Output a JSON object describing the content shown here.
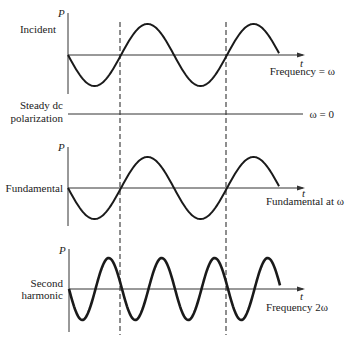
{
  "panels": [
    {
      "id": "incident",
      "label_lines": [
        "Incident"
      ],
      "axis_label_y": "P",
      "axis_label_x": "t",
      "note": "Frequency = ω",
      "frequency_multiple": 1
    },
    {
      "id": "steady-dc",
      "label_lines": [
        "Steady dc",
        "polarization"
      ],
      "note": "ω = 0",
      "frequency_multiple": 0
    },
    {
      "id": "fundamental",
      "label_lines": [
        "Fundamental"
      ],
      "axis_label_y": "P",
      "axis_label_x": "t",
      "note": "Fundamental at ω",
      "frequency_multiple": 1
    },
    {
      "id": "second-harmonic",
      "label_lines": [
        "Second",
        "harmonic"
      ],
      "axis_label_y": "P",
      "axis_label_x": "t",
      "note": "Frequency 2ω",
      "frequency_multiple": 2
    }
  ],
  "labels": {
    "incident": "Incident",
    "incident_note": "Frequency = ω",
    "dc_line1": "Steady dc",
    "dc_line2": "polarization",
    "dc_note": "ω = 0",
    "fundamental": "Fundamental",
    "fundamental_note": "Fundamental at ω",
    "second_line1": "Second",
    "second_line2": "harmonic",
    "second_note": "Frequency 2ω",
    "axis_p": "P",
    "axis_t": "t"
  },
  "colors": {
    "curve": "#1a1a1a",
    "axis": "#333333",
    "dashed": "#444444"
  }
}
